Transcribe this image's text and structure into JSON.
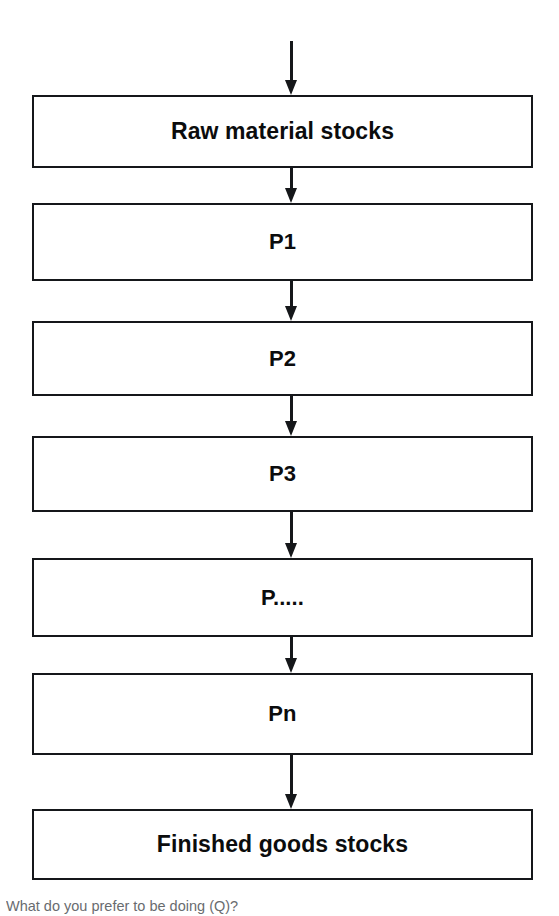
{
  "diagram": {
    "type": "flowchart",
    "orientation": "vertical",
    "colors": {
      "background": "#ffffff",
      "stroke": "#15171a",
      "text": "#0b0c0d",
      "caption": "#4e5256"
    },
    "nodes": [
      {
        "id": "raw-material-stocks",
        "label": "Raw material stocks",
        "shape": "rectangle",
        "size": "large"
      },
      {
        "id": "p1",
        "label": "P1",
        "shape": "rectangle",
        "size": "medium"
      },
      {
        "id": "p2",
        "label": "P2",
        "shape": "rectangle",
        "size": "medium"
      },
      {
        "id": "p3",
        "label": "P3",
        "shape": "rectangle",
        "size": "medium"
      },
      {
        "id": "p-ellipsis",
        "label": "P.....",
        "shape": "rectangle",
        "size": "medium"
      },
      {
        "id": "pn",
        "label": "Pn",
        "shape": "rectangle",
        "size": "medium"
      },
      {
        "id": "finished-goods-stocks",
        "label": "Finished goods stocks",
        "shape": "rectangle",
        "size": "large"
      }
    ],
    "edges": [
      {
        "id": "edge-input-to-raw",
        "from": "input",
        "to": "raw-material-stocks",
        "style": "solid-arrow-down"
      },
      {
        "id": "edge-raw-to-p1",
        "from": "raw-material-stocks",
        "to": "p1",
        "style": "solid-arrow-down"
      },
      {
        "id": "edge-p1-to-p2",
        "from": "p1",
        "to": "p2",
        "style": "solid-arrow-down"
      },
      {
        "id": "edge-p2-to-p3",
        "from": "p2",
        "to": "p3",
        "style": "solid-arrow-down"
      },
      {
        "id": "edge-p3-to-pdots",
        "from": "p3",
        "to": "p-ellipsis",
        "style": "solid-arrow-down"
      },
      {
        "id": "edge-pdots-to-pn",
        "from": "p-ellipsis",
        "to": "pn",
        "style": "solid-arrow-down"
      },
      {
        "id": "edge-pn-to-finished",
        "from": "pn",
        "to": "finished-goods-stocks",
        "style": "solid-arrow-down"
      }
    ],
    "caption": "What do you prefer to be doing (Q)?"
  }
}
